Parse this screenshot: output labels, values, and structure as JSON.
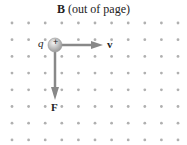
{
  "title": {
    "symbol": "B",
    "note": "(out of page)"
  },
  "labels": {
    "charge": "q",
    "charge_sign": "+",
    "velocity": "v",
    "force": "F"
  },
  "grid": {
    "cols": 11,
    "rows": 8,
    "x0": 12,
    "y0": 23,
    "dx": 16.6,
    "dy": 16.7,
    "dot_color": "#b0b0b0"
  },
  "colors": {
    "arrow": "#808080",
    "charge": "#c8c8c8"
  }
}
